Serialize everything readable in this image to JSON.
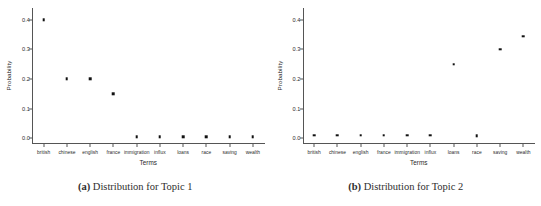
{
  "figure": {
    "subfigures": [
      {
        "caption_tag": "(a)",
        "caption_text": "Distribution for Topic 1",
        "chart_data": {
          "type": "scatter",
          "title": "",
          "xlabel": "Terms",
          "ylabel": "Probability",
          "categories": [
            "british",
            "chinese",
            "english",
            "france",
            "immigration",
            "influx",
            "loans",
            "race",
            "saving",
            "wealth"
          ],
          "values": [
            0.4,
            0.2,
            0.2,
            0.15,
            0.005,
            0.005,
            0.005,
            0.005,
            0.005,
            0.005
          ],
          "yticks": [
            "0.0",
            "0.1",
            "0.2",
            "0.3",
            "0.4"
          ],
          "ytickvalues": [
            0.0,
            0.1,
            0.2,
            0.3,
            0.4
          ],
          "ylim": [
            -0.02,
            0.44
          ],
          "grid": false,
          "legend": false,
          "marker": "square",
          "marker_color": "#111111"
        }
      },
      {
        "caption_tag": "(b)",
        "caption_text": "Distribution for Topic 2",
        "chart_data": {
          "type": "scatter",
          "title": "",
          "xlabel": "Terms",
          "ylabel": "Probability",
          "categories": [
            "british",
            "chinese",
            "english",
            "france",
            "immigration",
            "influx",
            "loans",
            "race",
            "saving",
            "wealth"
          ],
          "values": [
            0.01,
            0.01,
            0.01,
            0.01,
            0.01,
            0.01,
            0.25,
            0.008,
            0.3,
            0.345
          ],
          "yticks": [
            "0.0",
            "0.1",
            "0.2",
            "0.3",
            "0.4"
          ],
          "ytickvalues": [
            0.0,
            0.1,
            0.2,
            0.3,
            0.4
          ],
          "ylim": [
            -0.02,
            0.44
          ],
          "grid": false,
          "legend": false,
          "marker": "square",
          "marker_color": "#111111"
        }
      }
    ]
  }
}
